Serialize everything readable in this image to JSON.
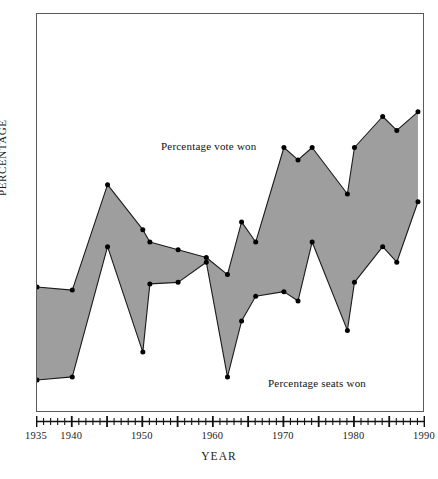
{
  "chart_data": {
    "type": "area",
    "title": "",
    "xlabel": "YEAR",
    "ylabel": "PERCENTAGE",
    "xlim": [
      1935,
      1990
    ],
    "ylim": [
      0,
      27
    ],
    "grid": false,
    "legend_position": "in-plot annotations",
    "x_major_ticks": [
      1935,
      1940,
      1945,
      1950,
      1955,
      1960,
      1965,
      1970,
      1975,
      1980,
      1985,
      1990
    ],
    "x_tick_labels": [
      "1935",
      "1940",
      "1950",
      "1960",
      "1970",
      "1980",
      "1990"
    ],
    "x_labeled_ticks": [
      1935,
      1940,
      1950,
      1960,
      1970,
      1980,
      1990
    ],
    "x_minor_tick_interval": 1,
    "y_ticks": [
      5,
      10,
      15,
      20,
      25
    ],
    "y_tick_labels": [
      "5%",
      "10%",
      "15%",
      "20%",
      "25%"
    ],
    "x": [
      1935,
      1940,
      1945,
      1950,
      1951,
      1955,
      1959,
      1962,
      1964,
      1966,
      1970,
      1972,
      1974,
      1979,
      1980,
      1984,
      1986,
      1989
    ],
    "series": [
      {
        "name": "Percentage vote won",
        "annotation": "Percentage vote won",
        "values": [
          9.0,
          8.8,
          15.6,
          12.7,
          11.9,
          11.4,
          10.9,
          9.8,
          13.2,
          11.9,
          18.0,
          17.2,
          18.0,
          15.0,
          18.0,
          20.0,
          19.1,
          20.3
        ]
      },
      {
        "name": "Percentage seats won",
        "annotation": "Percentage seats won",
        "values": [
          3.0,
          3.2,
          11.6,
          4.8,
          9.2,
          9.3,
          10.6,
          3.2,
          6.8,
          8.4,
          8.7,
          8.1,
          11.9,
          6.2,
          9.3,
          11.6,
          10.6,
          14.5
        ]
      }
    ],
    "fill_color": "#9e9e9e",
    "line_color": "#1a1a1a",
    "marker_color": "#000000",
    "frame_color": "#5a5a5a"
  },
  "axes": {
    "y_label": "PERCENTAGE",
    "x_label": "YEAR",
    "y_ticks": [
      "25%",
      "20%",
      "15%",
      "10%",
      "5%"
    ],
    "x_ticks": [
      "1935",
      "1940",
      "1950",
      "1960",
      "1970",
      "1980",
      "1990"
    ]
  },
  "annotations": {
    "vote": "Percentage vote won",
    "seats": "Percentage seats won"
  }
}
